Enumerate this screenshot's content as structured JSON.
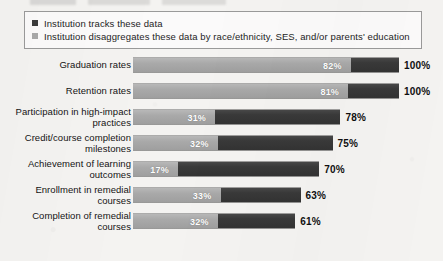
{
  "legend": {
    "items": [
      {
        "label": "Institution tracks these data",
        "swatch": "dark-square-icon",
        "color": "#3b3b3b"
      },
      {
        "label": "Institution disaggregates these data by race/ethnicity, SES, and/or parents' education",
        "swatch": "light-square-icon",
        "color": "#a9a9a9"
      }
    ]
  },
  "chart_data": {
    "type": "bar",
    "orientation": "horizontal",
    "title": "",
    "xlabel": "",
    "ylabel": "",
    "xlim": [
      0,
      100
    ],
    "grid": false,
    "legend_position": "top",
    "value_suffix": "%",
    "categories": [
      "Graduation rates",
      "Retention rates",
      "Participation in high-impact practices",
      "Credit/course completion milestones",
      "Achievement of learning outcomes",
      "Enrollment in remedial courses",
      "Completion of remedial courses"
    ],
    "series": [
      {
        "name": "Institution tracks these data",
        "color": "#3b3b3b",
        "values": [
          100,
          100,
          78,
          75,
          70,
          63,
          61
        ],
        "labels": [
          "100%",
          "100%",
          "78%",
          "75%",
          "70%",
          "63%",
          "61%"
        ]
      },
      {
        "name": "Institution disaggregates these data by race/ethnicity, SES, and/or parents' education",
        "color": "#a9a9a9",
        "values": [
          82,
          81,
          31,
          32,
          17,
          33,
          32
        ],
        "labels": [
          "82%",
          "81%",
          "31%",
          "32%",
          "17%",
          "33%",
          "32%"
        ]
      }
    ]
  }
}
